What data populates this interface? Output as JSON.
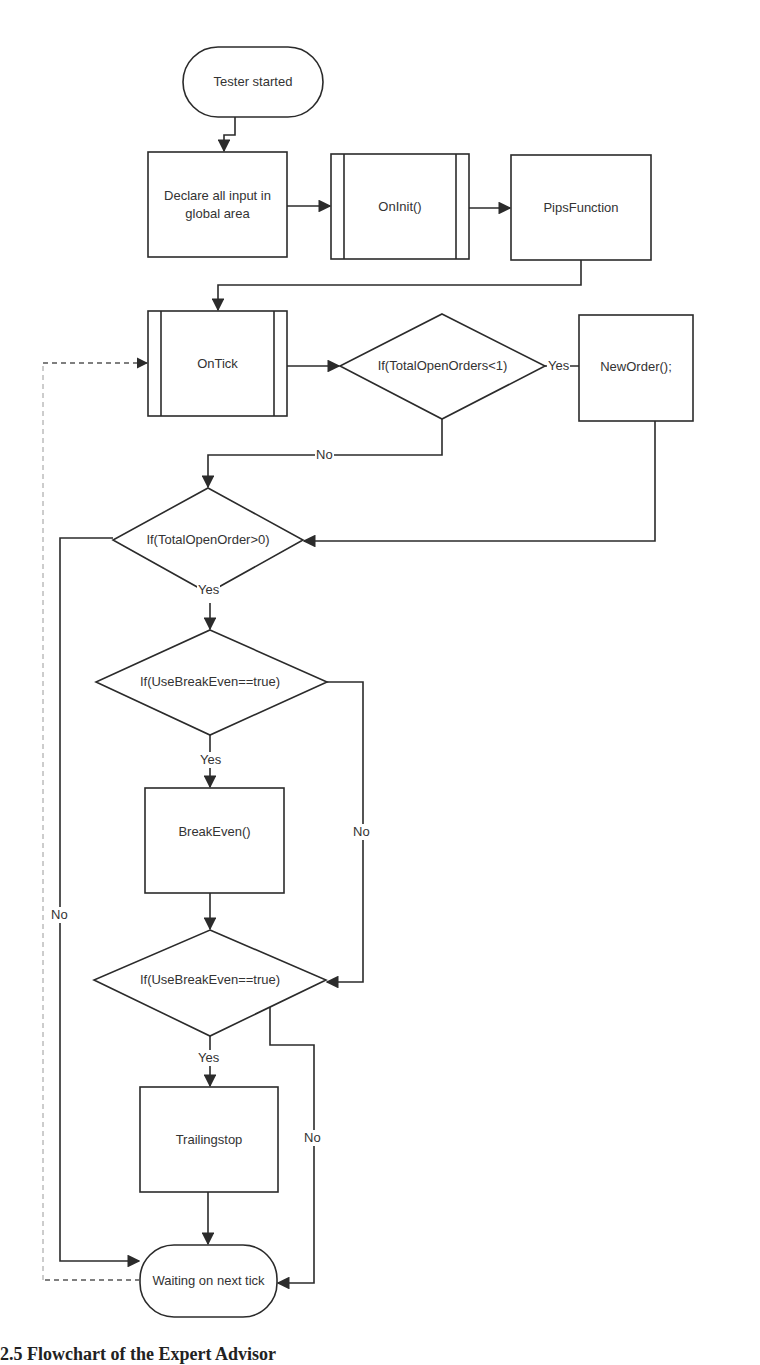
{
  "diagram": {
    "type": "flowchart",
    "nodes": {
      "start": {
        "label": "Tester started",
        "shape": "terminal"
      },
      "declare": {
        "label": "Declare all input in global area",
        "shape": "process"
      },
      "oninit": {
        "label": "OnInit()",
        "shape": "predefined-process"
      },
      "pips": {
        "label": "PipsFunction",
        "shape": "process"
      },
      "ontick": {
        "label": "OnTick",
        "shape": "predefined-process"
      },
      "cond_orders_lt1": {
        "label": "If(TotalOpenOrders<1)",
        "shape": "decision"
      },
      "neworder": {
        "label": "NewOrder();",
        "shape": "process"
      },
      "cond_orders_gt0": {
        "label": "If(TotalOpenOrder>0)",
        "shape": "decision"
      },
      "cond_breakeven_1": {
        "label": "If(UseBreakEven==true)",
        "shape": "decision"
      },
      "breakeven": {
        "label": "BreakEven()",
        "shape": "process"
      },
      "cond_breakeven_2": {
        "label": "If(UseBreakEven==true)",
        "shape": "decision"
      },
      "trailingstop": {
        "label": "Trailingstop",
        "shape": "process"
      },
      "waiting": {
        "label": "Waiting on next tick",
        "shape": "terminal"
      }
    },
    "edge_labels": {
      "lt1_yes": "Yes",
      "lt1_no": "No",
      "gt0_yes": "Yes",
      "gt0_no": "No",
      "be1_yes": "Yes",
      "be1_no": "No",
      "be2_yes": "Yes",
      "be2_no": "No"
    },
    "edges": [
      {
        "from": "start",
        "to": "declare"
      },
      {
        "from": "declare",
        "to": "oninit"
      },
      {
        "from": "oninit",
        "to": "pips"
      },
      {
        "from": "pips",
        "to": "ontick"
      },
      {
        "from": "ontick",
        "to": "cond_orders_lt1"
      },
      {
        "from": "cond_orders_lt1",
        "to": "neworder",
        "label": "Yes"
      },
      {
        "from": "cond_orders_lt1",
        "to": "cond_orders_gt0",
        "label": "No"
      },
      {
        "from": "neworder",
        "to": "cond_orders_gt0"
      },
      {
        "from": "cond_orders_gt0",
        "to": "cond_breakeven_1",
        "label": "Yes"
      },
      {
        "from": "cond_orders_gt0",
        "to": "waiting",
        "label": "No"
      },
      {
        "from": "cond_breakeven_1",
        "to": "breakeven",
        "label": "Yes"
      },
      {
        "from": "cond_breakeven_1",
        "to": "cond_breakeven_2",
        "label": "No"
      },
      {
        "from": "breakeven",
        "to": "cond_breakeven_2"
      },
      {
        "from": "cond_breakeven_2",
        "to": "trailingstop",
        "label": "Yes"
      },
      {
        "from": "cond_breakeven_2",
        "to": "waiting",
        "label": "No"
      },
      {
        "from": "trailingstop",
        "to": "waiting"
      },
      {
        "from": "waiting",
        "to": "ontick",
        "style": "dashed"
      }
    ]
  },
  "caption": "2.5 Flowchart of the Expert Advisor"
}
